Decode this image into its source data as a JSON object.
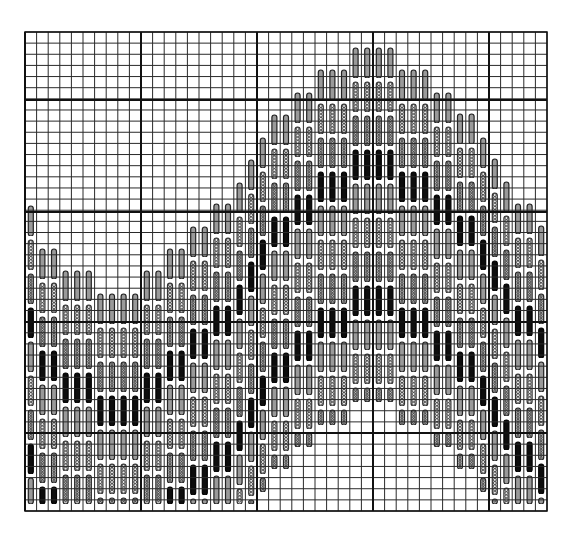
{
  "title": "Stitch chart: mountain motif",
  "grid": {
    "x0": 25,
    "y0": 32,
    "x1": 547,
    "y1": 511,
    "cols": 45,
    "rows": 43,
    "major_every": 10,
    "major_x": [
      25,
      141,
      257,
      373,
      489
    ],
    "major_y": [
      100,
      212,
      322,
      433
    ],
    "line_color": "#2a2a2a",
    "major_line_color": "#111111",
    "background": "#ffffff"
  },
  "stitch_legend": [
    {
      "name": "plain-outline",
      "fill": "#9a9a9a",
      "stroke": "#222222"
    },
    {
      "name": "chain",
      "fill": "#e8e8e8",
      "stroke": "#333333"
    },
    {
      "name": "ribbed",
      "fill": "#bdbdbd",
      "stroke": "#222222"
    },
    {
      "name": "solid",
      "fill": "#0d0d0d",
      "stroke": "#000000"
    }
  ],
  "segment_height": 34,
  "columns": [
    {
      "col": 0,
      "top": 205,
      "bottom": 507
    },
    {
      "col": 1,
      "top": 248,
      "bottom": 507
    },
    {
      "col": 2,
      "top": 248,
      "bottom": 507
    },
    {
      "col": 3,
      "top": 270,
      "bottom": 507
    },
    {
      "col": 4,
      "top": 270,
      "bottom": 507
    },
    {
      "col": 5,
      "top": 270,
      "bottom": 507
    },
    {
      "col": 6,
      "top": 293,
      "bottom": 507
    },
    {
      "col": 7,
      "top": 293,
      "bottom": 507
    },
    {
      "col": 8,
      "top": 293,
      "bottom": 507
    },
    {
      "col": 9,
      "top": 293,
      "bottom": 507
    },
    {
      "col": 10,
      "top": 270,
      "bottom": 507
    },
    {
      "col": 11,
      "top": 270,
      "bottom": 507
    },
    {
      "col": 12,
      "top": 248,
      "bottom": 507
    },
    {
      "col": 13,
      "top": 248,
      "bottom": 507
    },
    {
      "col": 14,
      "top": 226,
      "bottom": 507
    },
    {
      "col": 15,
      "top": 226,
      "bottom": 507
    },
    {
      "col": 16,
      "top": 203,
      "bottom": 507
    },
    {
      "col": 17,
      "top": 203,
      "bottom": 507
    },
    {
      "col": 18,
      "top": 182,
      "bottom": 507
    },
    {
      "col": 19,
      "top": 159,
      "bottom": 507
    },
    {
      "col": 20,
      "top": 137,
      "bottom": 495
    },
    {
      "col": 21,
      "top": 114,
      "bottom": 472
    },
    {
      "col": 22,
      "top": 114,
      "bottom": 472
    },
    {
      "col": 23,
      "top": 92,
      "bottom": 450
    },
    {
      "col": 24,
      "top": 92,
      "bottom": 450
    },
    {
      "col": 25,
      "top": 69,
      "bottom": 428
    },
    {
      "col": 26,
      "top": 69,
      "bottom": 428
    },
    {
      "col": 27,
      "top": 69,
      "bottom": 428
    },
    {
      "col": 28,
      "top": 47,
      "bottom": 405
    },
    {
      "col": 29,
      "top": 47,
      "bottom": 405
    },
    {
      "col": 30,
      "top": 47,
      "bottom": 405
    },
    {
      "col": 31,
      "top": 47,
      "bottom": 405
    },
    {
      "col": 32,
      "top": 69,
      "bottom": 428
    },
    {
      "col": 33,
      "top": 69,
      "bottom": 428
    },
    {
      "col": 34,
      "top": 69,
      "bottom": 428
    },
    {
      "col": 35,
      "top": 92,
      "bottom": 450
    },
    {
      "col": 36,
      "top": 92,
      "bottom": 450
    },
    {
      "col": 37,
      "top": 113,
      "bottom": 472
    },
    {
      "col": 38,
      "top": 113,
      "bottom": 472
    },
    {
      "col": 39,
      "top": 137,
      "bottom": 495
    },
    {
      "col": 40,
      "top": 158,
      "bottom": 507
    },
    {
      "col": 41,
      "top": 181,
      "bottom": 507
    },
    {
      "col": 42,
      "top": 203,
      "bottom": 507
    },
    {
      "col": 43,
      "top": 203,
      "bottom": 507
    },
    {
      "col": 44,
      "top": 225,
      "bottom": 507
    }
  ]
}
